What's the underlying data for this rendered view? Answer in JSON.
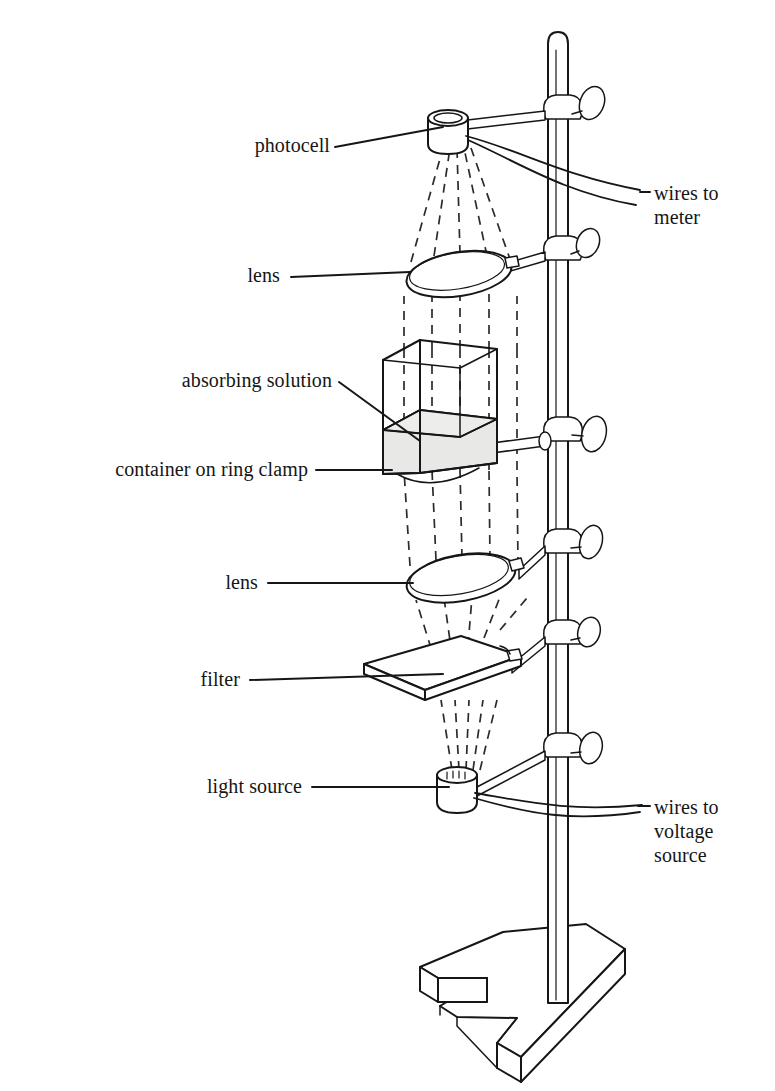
{
  "figure": {
    "type": "line-diagram",
    "background_color": "#ffffff",
    "ink_color": "#161616",
    "solution_fill_color": "#e8e8e6",
    "label_font_size_px": 20
  },
  "labels": {
    "photocell": "photocell",
    "lens_top": "lens",
    "absorbing_solution": "absorbing solution",
    "container_on_ring_clamp": "container on ring clamp",
    "lens_bottom": "lens",
    "filter": "filter",
    "light_source": "light source",
    "wires_to_meter_line1": "wires to",
    "wires_to_meter_line2": "meter",
    "wires_to_voltage_line1": "wires to",
    "wires_to_voltage_line2": "voltage",
    "wires_to_voltage_line3": "source"
  },
  "components": [
    {
      "name": "photocell",
      "label": "photocell",
      "shape": "cylinder",
      "y": 125
    },
    {
      "name": "lens-upper",
      "label": "lens",
      "shape": "ellipse-ring",
      "y": 270
    },
    {
      "name": "sample-container",
      "label": "container on ring clamp",
      "shape": "open-box",
      "y": 415
    },
    {
      "name": "absorbing-solution",
      "label": "absorbing solution",
      "shape": "filled-liquid",
      "y": 450
    },
    {
      "name": "lens-lower",
      "label": "lens",
      "shape": "ellipse-ring",
      "y": 578
    },
    {
      "name": "filter",
      "label": "filter",
      "shape": "flat-plate",
      "y": 672
    },
    {
      "name": "light-source",
      "label": "light source",
      "shape": "cylinder",
      "y": 782
    },
    {
      "name": "ring-stand-pole",
      "label": "",
      "shape": "vertical-rod",
      "y": 500
    },
    {
      "name": "ring-stand-base",
      "label": "",
      "shape": "tripod-base",
      "y": 980
    }
  ],
  "clamp_count": 6,
  "light_beam": {
    "style": "dashed",
    "direction": "upward from light source to photocell"
  }
}
